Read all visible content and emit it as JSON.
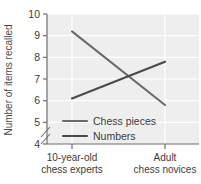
{
  "chart_data": {
    "type": "line",
    "title": "",
    "xlabel": "",
    "ylabel": "Number of items recalled",
    "categories": [
      "10-year-old chess experts",
      "Adult chess novices"
    ],
    "category_lines": [
      [
        "10-year-old",
        "chess experts"
      ],
      [
        "Adult",
        "chess novices"
      ]
    ],
    "series": [
      {
        "name": "Chess pieces",
        "values": [
          9.2,
          5.8
        ],
        "color": "#6b6b6b"
      },
      {
        "name": "Numbers",
        "values": [
          6.1,
          7.8
        ],
        "color": "#4a4a4a"
      }
    ],
    "ylim": [
      4,
      10
    ],
    "yticks": [
      4,
      5,
      6,
      7,
      8,
      9,
      10
    ],
    "ytick_labels": [
      "4",
      "5",
      "6",
      "7",
      "8",
      "9",
      "10"
    ],
    "y_axis_break": true,
    "grid": true,
    "grid_color": "#ffffff",
    "plot_background": "#eeeeee",
    "legend_position": "inside-lower-left"
  },
  "axis": {
    "y_title": "Number of items recalled"
  },
  "legend": {
    "items": [
      {
        "label": "Chess pieces"
      },
      {
        "label": "Numbers"
      }
    ]
  }
}
